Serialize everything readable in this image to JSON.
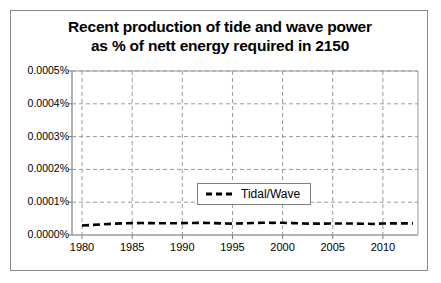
{
  "chart_data": {
    "type": "line",
    "title": "Recent production of tide and wave power as % of nett energy required in 2150",
    "title_line1": "Recent production of tide and wave power",
    "title_line2": "as % of nett energy required in 2150",
    "xlabel": "",
    "ylabel": "",
    "grid": true,
    "legend_position": "center",
    "xlim": [
      1979,
      2013.5
    ],
    "ylim": [
      0.0,
      0.0005
    ],
    "x_ticks": [
      1980,
      1985,
      1990,
      1995,
      2000,
      2005,
      2010
    ],
    "x_tick_labels": [
      "1980",
      "1985",
      "1990",
      "1995",
      "2000",
      "2005",
      "2010"
    ],
    "y_ticks": [
      0.0,
      0.0001,
      0.0002,
      0.0003,
      0.0004,
      0.0005
    ],
    "y_tick_labels": [
      "0.0000%",
      "0.0001%",
      "0.0002%",
      "0.0003%",
      "0.0004%",
      "0.0005%"
    ],
    "y_unit": "%",
    "series": [
      {
        "name": "Tidal/Wave",
        "color": "#000000",
        "line_style": "dashed",
        "x": [
          1980,
          1981,
          1982,
          1983,
          1984,
          1985,
          1986,
          1987,
          1988,
          1989,
          1990,
          1991,
          1992,
          1993,
          1994,
          1995,
          1996,
          1997,
          1998,
          1999,
          2000,
          2001,
          2002,
          2003,
          2004,
          2005,
          2006,
          2007,
          2008,
          2009,
          2010,
          2011,
          2012,
          2013
        ],
        "values": [
          2.9e-05,
          3.06e-05,
          3.25e-05,
          3.42e-05,
          3.55e-05,
          3.62e-05,
          3.64e-05,
          3.61e-05,
          3.57e-05,
          3.58e-05,
          3.62e-05,
          3.68e-05,
          3.69e-05,
          3.63e-05,
          3.52e-05,
          3.48e-05,
          3.54e-05,
          3.64e-05,
          3.72e-05,
          3.71e-05,
          3.72e-05,
          3.62e-05,
          3.51e-05,
          3.46e-05,
          3.48e-05,
          3.51e-05,
          3.53e-05,
          3.49e-05,
          3.45e-05,
          3.37e-05,
          3.52e-05,
          3.54e-05,
          3.54e-05,
          3.54e-05
        ]
      }
    ]
  },
  "legend": {
    "entries": [
      {
        "label": "Tidal/Wave",
        "color": "#000000",
        "style": "dashed"
      }
    ]
  }
}
